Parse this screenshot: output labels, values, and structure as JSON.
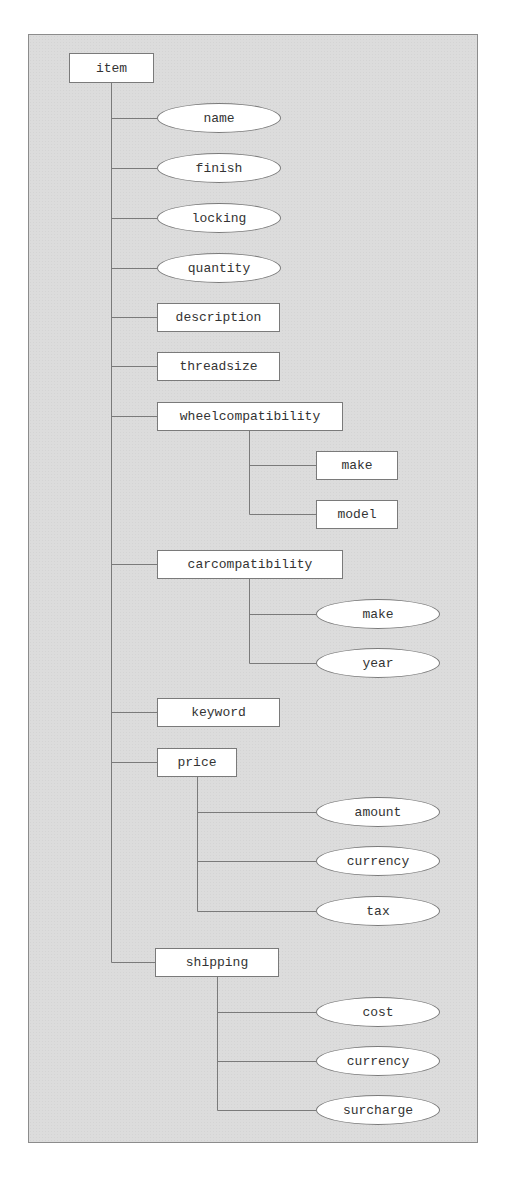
{
  "diagram": {
    "type": "tree",
    "root": {
      "label": "item",
      "shape": "rect",
      "children": [
        {
          "label": "name",
          "shape": "ellipse"
        },
        {
          "label": "finish",
          "shape": "ellipse"
        },
        {
          "label": "locking",
          "shape": "ellipse"
        },
        {
          "label": "quantity",
          "shape": "ellipse"
        },
        {
          "label": "description",
          "shape": "rect"
        },
        {
          "label": "threadsize",
          "shape": "rect"
        },
        {
          "label": "wheelcompatibility",
          "shape": "rect",
          "children": [
            {
              "label": "make",
              "shape": "rect"
            },
            {
              "label": "model",
              "shape": "rect"
            }
          ]
        },
        {
          "label": "carcompatibility",
          "shape": "rect",
          "children": [
            {
              "label": "make",
              "shape": "ellipse"
            },
            {
              "label": "year",
              "shape": "ellipse"
            }
          ]
        },
        {
          "label": "keyword",
          "shape": "rect"
        },
        {
          "label": "price",
          "shape": "rect",
          "children": [
            {
              "label": "amount",
              "shape": "ellipse"
            },
            {
              "label": "currency",
              "shape": "ellipse"
            },
            {
              "label": "tax",
              "shape": "ellipse"
            }
          ]
        },
        {
          "label": "shipping",
          "shape": "rect",
          "children": [
            {
              "label": "cost",
              "shape": "ellipse"
            },
            {
              "label": "currency",
              "shape": "ellipse"
            },
            {
              "label": "surcharge",
              "shape": "ellipse"
            }
          ]
        }
      ]
    }
  },
  "nodes": {
    "item": "item",
    "name": "name",
    "finish": "finish",
    "locking": "locking",
    "quantity": "quantity",
    "description": "description",
    "threadsize": "threadsize",
    "wheelcompatibility": "wheelcompatibility",
    "wheel_make": "make",
    "wheel_model": "model",
    "carcompatibility": "carcompatibility",
    "car_make": "make",
    "car_year": "year",
    "keyword": "keyword",
    "price": "price",
    "price_amount": "amount",
    "price_currency": "currency",
    "price_tax": "tax",
    "shipping": "shipping",
    "shipping_cost": "cost",
    "shipping_currency": "currency",
    "shipping_surcharge": "surcharge"
  },
  "colors": {
    "background": "#dcdcdc",
    "node_fill": "#ffffff",
    "stroke": "#7a7a7a",
    "text": "#333333"
  }
}
